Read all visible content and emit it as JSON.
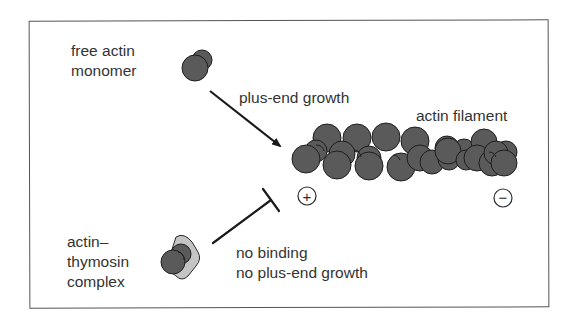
{
  "diagram": {
    "labels": {
      "free_monomer_line1": "free actin",
      "free_monomer_line2": "monomer",
      "plus_end_growth": "plus-end growth",
      "actin_filament": "actin filament",
      "complex_line1": "actin–",
      "complex_line2": "thymosin",
      "complex_line3": "complex",
      "no_binding_line1": "no binding",
      "no_binding_line2": "no plus-end growth"
    },
    "end_markers": {
      "plus": "+",
      "minus": "−"
    },
    "colors": {
      "actin_fill": "#5a5a5a",
      "actin_outline": "#1e1e1e",
      "thymosin_fill": "#c4c4c4",
      "line": "#1a1a1a",
      "frame": "#555555"
    }
  }
}
